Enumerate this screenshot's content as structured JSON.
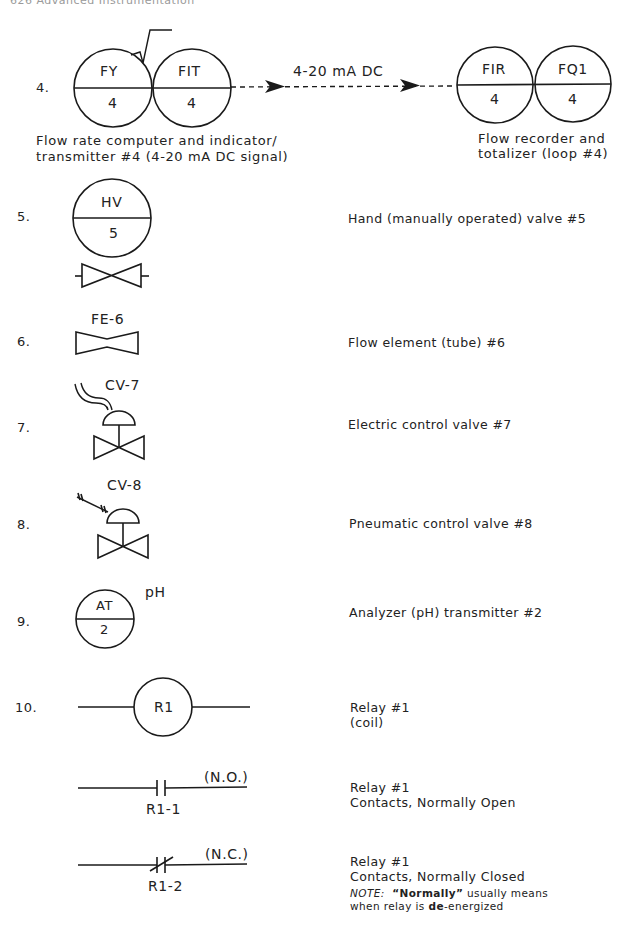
{
  "running_head": "626  Advanced Instrumentation",
  "items": [
    {
      "number": "4.",
      "symbols": {
        "left_pair": [
          {
            "top": "FY",
            "bottom": "4"
          },
          {
            "top": "FIT",
            "bottom": "4"
          }
        ],
        "signal_label": "4-20 mA DC",
        "right_pair": [
          {
            "top": "FIR",
            "bottom": "4"
          },
          {
            "top": "FQ1",
            "bottom": "4"
          }
        ],
        "square_root_mark": "√"
      },
      "left_caption": [
        "Flow rate computer and indicator/",
        "transmitter #4 (4-20 mA DC signal)"
      ],
      "right_caption": [
        "Flow recorder and",
        "totalizer (loop #4)"
      ]
    },
    {
      "number": "5.",
      "symbol": {
        "top": "HV",
        "bottom": "5"
      },
      "description": "Hand (manually operated) valve #5"
    },
    {
      "number": "6.",
      "symbol_label": "FE-6",
      "description": "Flow element (tube) #6"
    },
    {
      "number": "7.",
      "symbol_label": "CV-7",
      "description": "Electric control valve #7"
    },
    {
      "number": "8.",
      "symbol_label": "CV-8",
      "description": "Pneumatic control valve #8"
    },
    {
      "number": "9.",
      "symbol": {
        "top": "AT",
        "bottom": "2",
        "annotation": "pH"
      },
      "description": "Analyzer (pH) transmitter #2"
    },
    {
      "number": "10.",
      "coil": {
        "label": "R1",
        "description": [
          "Relay #1",
          "(coil)"
        ]
      },
      "no_contact": {
        "label": "R1-1",
        "type": "(N.O.)",
        "description": [
          "Relay #1",
          "Contacts, Normally Open"
        ]
      },
      "nc_contact": {
        "label": "R1-2",
        "type": "(N.C.)",
        "description": [
          "Relay #1",
          "Contacts, Normally Closed"
        ]
      },
      "note": {
        "prefix": "NOTE:",
        "quoted": "“Normally”",
        "mid": " usually means",
        "line2_pre": "when relay is ",
        "line2_bold": "de",
        "line2_post": "-energized"
      }
    }
  ]
}
